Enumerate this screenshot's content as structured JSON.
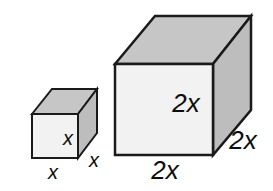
{
  "figure": {
    "background_color": "#ffffff",
    "outline_color": "#1a1a1a",
    "shapes": [
      {
        "name": "small-cube",
        "edge_length_label": "x",
        "front_face_color": "#f2f2f2",
        "top_face_color": "#c6c6c6",
        "side_face_color": "#bdbdbd",
        "labels": {
          "front_height": "x",
          "depth": "x",
          "width": "x"
        }
      },
      {
        "name": "large-cube",
        "edge_length_label": "2x",
        "front_face_color": "#f2f2f2",
        "top_face_color": "#c6c6c6",
        "side_face_color": "#bdbdbd",
        "labels": {
          "front_height": "2x",
          "depth": "2x",
          "width": "2x"
        }
      }
    ]
  }
}
